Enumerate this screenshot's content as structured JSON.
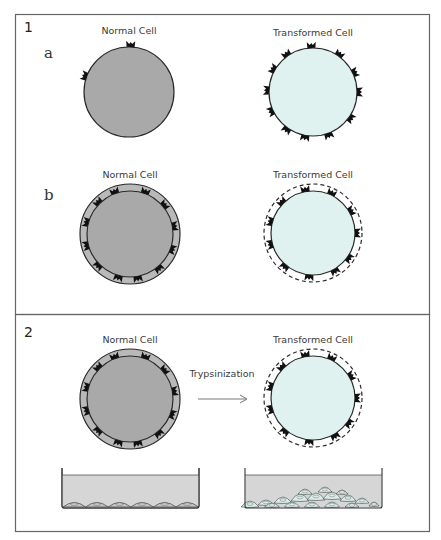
{
  "figure": {
    "panel1": {
      "number": "1",
      "row_a": {
        "letter": "a",
        "normal_label": "Normal Cell",
        "transformed_label": "Transformed Cell"
      },
      "row_b": {
        "letter": "b",
        "normal_label": "Normal Cell",
        "transformed_label": "Transformed Cell"
      }
    },
    "panel2": {
      "number": "2",
      "normal_label": "Normal Cell",
      "transformed_label": "Transformed Cell",
      "arrow_label": "Trypsinization",
      "dishes": [
        {
          "name": "normal-culture-dish",
          "growth": "monolayer"
        },
        {
          "name": "transformed-culture-dish",
          "growth": "piled-up multilayer"
        }
      ]
    },
    "colors": {
      "normal_cell_fill": "#a9a9a9",
      "normal_coat_fill": "#b9b9b9",
      "transformed_cell_fill": "#dff2ef",
      "outline": "#2a2a2a",
      "frame": "#555555",
      "medium_fill": "#d4d4d4"
    }
  }
}
